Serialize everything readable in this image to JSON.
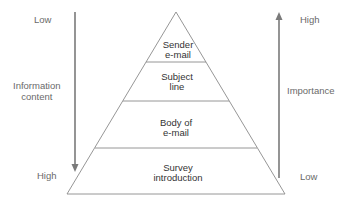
{
  "diagram": {
    "type": "pyramid",
    "tiers": [
      {
        "line1": "Sender",
        "line2": "e-mail"
      },
      {
        "line1": "Subject",
        "line2": "line"
      },
      {
        "line1": "Body of",
        "line2": "e-mail"
      },
      {
        "line1": "Survey",
        "line2": "introduction"
      }
    ],
    "left_axis": {
      "top_label": "Low",
      "middle_label_line1": "Information",
      "middle_label_line2": "content",
      "bottom_label": "High",
      "direction": "down"
    },
    "right_axis": {
      "top_label": "High",
      "middle_label": "Importance",
      "bottom_label": "Low",
      "direction": "up"
    },
    "colors": {
      "outline": "#8a8a8a",
      "arrow": "#7a7a7a",
      "text": "#555555"
    }
  }
}
